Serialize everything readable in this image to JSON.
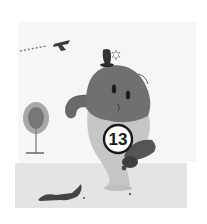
{
  "illustration": {
    "subject": "Cartoon bean-shaped character wearing shorts with number badge, kicking, grayscale",
    "jersey_number": "13",
    "colors": {
      "background": "#ffffff",
      "sky_band": "#f0f0f0",
      "ground": "#e6e6e6",
      "body": "#6f6f6f",
      "shorts": "#c4c4c4",
      "dark": "#2a2a2a",
      "badge_fill": "#ffffff",
      "tree_foliage": "#9a9a9a",
      "tree_dark": "#5e5e5e"
    }
  }
}
